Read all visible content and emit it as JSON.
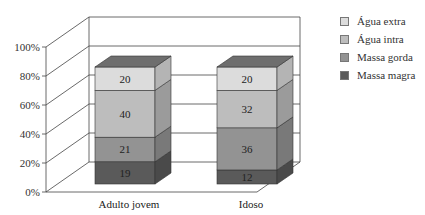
{
  "chart_data": {
    "type": "bar",
    "subtype": "stacked-100-3d",
    "categories": [
      "Adulto jovem",
      "Idoso"
    ],
    "series": [
      {
        "name": "Massa magra",
        "values": [
          19,
          12
        ],
        "color": "#5a5a5a"
      },
      {
        "name": "Massa gorda",
        "values": [
          21,
          36
        ],
        "color": "#939393"
      },
      {
        "name": "Água intra",
        "values": [
          40,
          32
        ],
        "color": "#bdbdbd"
      },
      {
        "name": "Água extra",
        "values": [
          20,
          20
        ],
        "color": "#dcdcdc"
      }
    ],
    "ylim": [
      0,
      100
    ],
    "yticks": [
      "0%",
      "20%",
      "40%",
      "60%",
      "80%",
      "100%"
    ],
    "title": "",
    "xlabel": "",
    "ylabel": "",
    "legend_position": "right",
    "grid": true
  },
  "legend": {
    "items": [
      {
        "label": "Água extra",
        "color": "#dcdcdc"
      },
      {
        "label": "Água intra",
        "color": "#bdbdbd"
      },
      {
        "label": "Massa gorda",
        "color": "#939393"
      },
      {
        "label": "Massa magra",
        "color": "#5a5a5a"
      }
    ]
  }
}
